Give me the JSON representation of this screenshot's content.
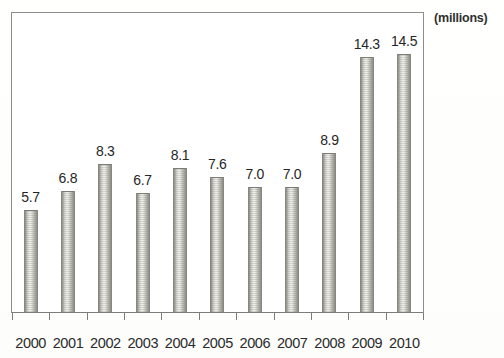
{
  "chart_data": {
    "type": "bar",
    "title": "",
    "subtitle": "",
    "units_label": "(millions)",
    "xlabel": "",
    "ylabel": "",
    "categories": [
      "2000",
      "2001",
      "2002",
      "2003",
      "2004",
      "2005",
      "2006",
      "2007",
      "2008",
      "2009",
      "2010"
    ],
    "values": [
      5.7,
      6.8,
      8.3,
      6.7,
      8.1,
      7.6,
      7.0,
      7.0,
      8.9,
      14.3,
      14.5
    ],
    "value_labels": [
      "5.7",
      "6.8",
      "8.3",
      "6.7",
      "8.1",
      "7.6",
      "7.0",
      "7.0",
      "8.9",
      "14.3",
      "14.5"
    ],
    "ylim": [
      0,
      16.1
    ],
    "grid": false,
    "legend": null,
    "axis_ticks_visible": true,
    "bar_fill": "#cfcfc9",
    "bar_edge": "#87877f",
    "frame_color": "#8d8d8a",
    "text_color": "#262626",
    "background": "#ffffff"
  }
}
